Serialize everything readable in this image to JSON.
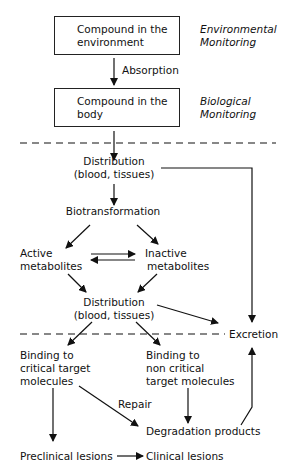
{
  "nodes": {
    "env_compound": [
      "Compound in the",
      "environment"
    ],
    "env_monitoring": [
      "Environmental",
      "Monitoring"
    ],
    "absorption": "Absorption",
    "body_compound": [
      "Compound in the",
      "body"
    ],
    "bio_monitoring": [
      "Biological",
      "Monitoring"
    ],
    "distribution1": [
      "Distribution",
      "(blood, tissues)"
    ],
    "biotransformation": "Biotransformation",
    "active": [
      "Active",
      "metabolites"
    ],
    "inactive": [
      "Inactive",
      "metabolites"
    ],
    "distribution2": [
      "Distribution",
      "(blood, tissues)"
    ],
    "excretion": "Excretion",
    "binding_critical": [
      "Binding to",
      "critical target",
      "molecules"
    ],
    "binding_noncritical": [
      "Binding to",
      "non critical",
      "target molecules"
    ],
    "repair": "Repair",
    "degradation": "Degradation products",
    "preclinical": "Preclinical lesions",
    "clinical": "Clinical lesions"
  },
  "colors": {
    "ink": "#111111",
    "background": "#ffffff"
  }
}
